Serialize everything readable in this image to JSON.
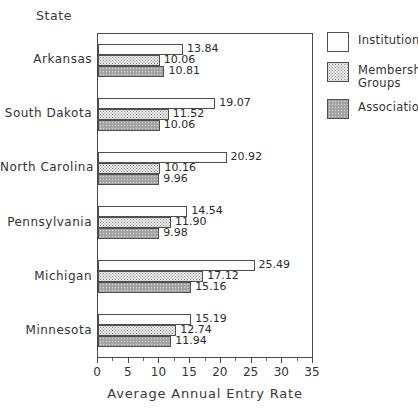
{
  "chart_data": {
    "type": "bar",
    "orientation": "horizontal",
    "title": "",
    "xlabel": "Average Annual Entry Rate",
    "ylabel": "State",
    "xlim": [
      0,
      35
    ],
    "xticks": [
      0,
      5,
      10,
      15,
      20,
      25,
      30,
      35
    ],
    "xticklabels": [
      "0",
      "5",
      "10",
      "15",
      "20",
      "25",
      "30",
      "35"
    ],
    "grid": false,
    "legend_position": "right",
    "categories": [
      "Arkansas",
      "South Dakota",
      "North Carolina",
      "Pennsylvania",
      "Michigan",
      "Minnesota"
    ],
    "series": [
      {
        "name": "Institutions",
        "values": [
          13.84,
          19.07,
          20.92,
          14.54,
          25.49,
          15.19
        ],
        "labels": [
          "13.84",
          "19.07",
          "20.92",
          "14.54",
          "25.49",
          "15.19"
        ],
        "fill": "light-dotted",
        "color": "#fdfdfd"
      },
      {
        "name": "Membership Groups",
        "values": [
          10.06,
          11.52,
          10.16,
          11.9,
          17.12,
          12.74
        ],
        "labels": [
          "10.06",
          "11.52",
          "10.16",
          "11.90",
          "17.12",
          "12.74"
        ],
        "fill": "medium-dotted",
        "color": "#ececec"
      },
      {
        "name": "Associations",
        "values": [
          10.81,
          10.06,
          9.96,
          9.98,
          15.16,
          11.94
        ],
        "labels": [
          "10.81",
          "10.06",
          "9.96",
          "9.98",
          "15.16",
          "11.94"
        ],
        "fill": "dark-dotted",
        "color": "#a8a8a8"
      }
    ]
  },
  "legend": {
    "items": [
      {
        "label": "Institutions"
      },
      {
        "label": "Membership Groups"
      },
      {
        "label": "Associations"
      }
    ]
  }
}
